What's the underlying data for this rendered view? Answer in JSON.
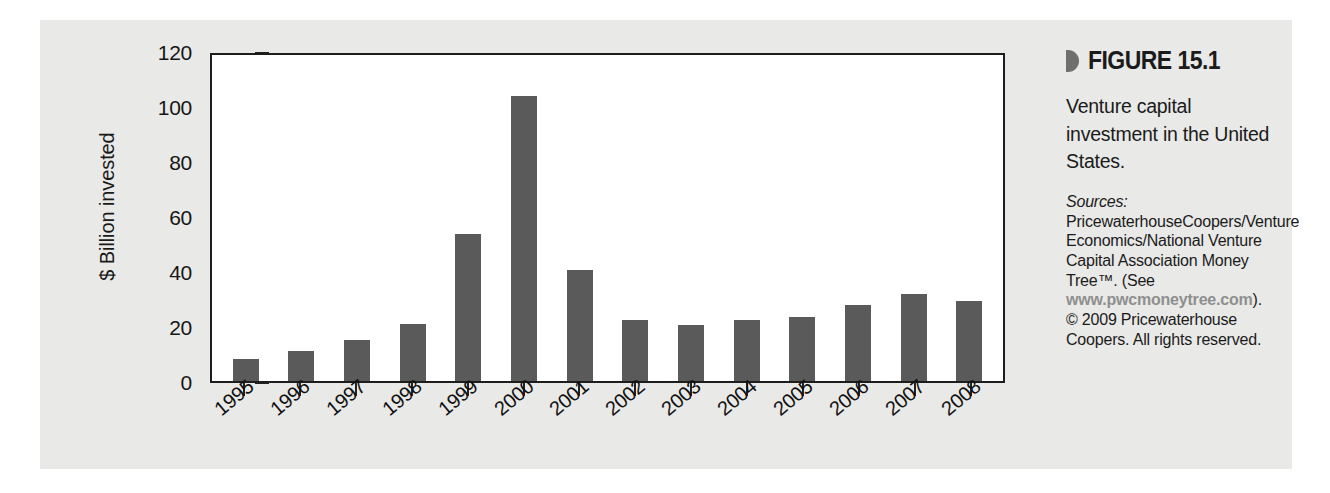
{
  "chart_data": {
    "type": "bar",
    "title": "",
    "xlabel": "",
    "ylabel": "$ Billion invested",
    "ylim": [
      0,
      120
    ],
    "yticks": [
      0,
      20,
      40,
      60,
      80,
      100,
      120
    ],
    "grid": false,
    "legend": "none",
    "categories": [
      "1995",
      "1996",
      "1997",
      "1998",
      "1999",
      "2000",
      "2001",
      "2002",
      "2003",
      "2004",
      "2005",
      "2006",
      "2007",
      "2008"
    ],
    "values": [
      8,
      11,
      15,
      21,
      54,
      105,
      41,
      22.5,
      20.5,
      22.5,
      23.5,
      28,
      32,
      29.5
    ]
  },
  "figure": {
    "marker_icon": "triangle-right-icon",
    "label": "FIGURE 15.1",
    "caption": "Venture capital investment in the United States.",
    "sources": {
      "label": "Sources:",
      "body": " PricewaterhouseCoopers/Venture Economics/National Venture Capital Association Money Tree™. (See ",
      "url": "www.pwcmoneytree.com",
      "body_end": ").",
      "copyright": "© 2009 Pricewaterhouse Coopers. All rights reserved."
    }
  },
  "colors": {
    "bar": "#5a5a5a",
    "panel_background": "#e9e9e7",
    "plot_background": "#ffffff",
    "axis": "#1d1d1d",
    "url": "#8f8f8f"
  }
}
